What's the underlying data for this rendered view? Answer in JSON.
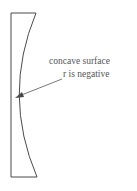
{
  "diagram": {
    "labels": {
      "line1": "concave surface",
      "line2": "r is negative"
    },
    "colors": {
      "stroke": "#4a4a4a",
      "text": "#555555",
      "background": "#ffffff"
    },
    "shapes": {
      "lens": "plano-concave lens outline (flat left face, concave right face)",
      "arrow": "leader arrow pointing from label to concave surface"
    }
  }
}
